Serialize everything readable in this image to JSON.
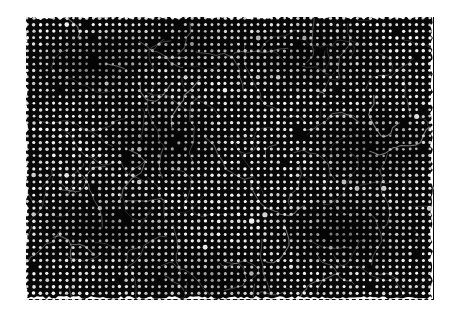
{
  "page": {
    "width": 462,
    "height": 316,
    "background_color": "#ffffff",
    "document_type": "scanned-halftone-photograph",
    "caption": ""
  },
  "plate": {
    "name": "halftone-screened-photograph",
    "x": 26,
    "y": 17,
    "width": 408,
    "height": 283,
    "ink_color": "#070707",
    "dot_color": "#ffffff",
    "description": "Dense black halftone screen; a dark, low-key photographic reproduction rendered as a regular grid of small white dots on solid black ink.",
    "halftone": {
      "pitch_x": 6.6,
      "pitch_y": 6.55,
      "dot_radius": 1.55,
      "screen_angle_deg": 0,
      "dot_shape": "round",
      "row_offset": 0
    },
    "edges": {
      "ragged": true,
      "ragged_amplitude_px": 3
    },
    "tone_blotches": [
      {
        "cx": 0.16,
        "cy": 0.17,
        "rx": 0.18,
        "ry": 0.15,
        "level": -0.22
      },
      {
        "cx": 0.4,
        "cy": 0.1,
        "rx": 0.22,
        "ry": 0.12,
        "level": -0.16
      },
      {
        "cx": 0.7,
        "cy": 0.14,
        "rx": 0.2,
        "ry": 0.14,
        "level": -0.18
      },
      {
        "cx": 0.92,
        "cy": 0.2,
        "rx": 0.14,
        "ry": 0.18,
        "level": 0.14
      },
      {
        "cx": 0.09,
        "cy": 0.47,
        "rx": 0.14,
        "ry": 0.2,
        "level": 0.16
      },
      {
        "cx": 0.33,
        "cy": 0.43,
        "rx": 0.19,
        "ry": 0.17,
        "level": -0.2
      },
      {
        "cx": 0.6,
        "cy": 0.4,
        "rx": 0.17,
        "ry": 0.16,
        "level": 0.12
      },
      {
        "cx": 0.84,
        "cy": 0.46,
        "rx": 0.18,
        "ry": 0.17,
        "level": -0.22
      },
      {
        "cx": 0.2,
        "cy": 0.74,
        "rx": 0.2,
        "ry": 0.16,
        "level": -0.18
      },
      {
        "cx": 0.5,
        "cy": 0.7,
        "rx": 0.22,
        "ry": 0.18,
        "level": 0.13
      },
      {
        "cx": 0.78,
        "cy": 0.76,
        "rx": 0.19,
        "ry": 0.16,
        "level": -0.24
      },
      {
        "cx": 0.96,
        "cy": 0.64,
        "rx": 0.12,
        "ry": 0.2,
        "level": 0.15
      },
      {
        "cx": 0.44,
        "cy": 0.92,
        "rx": 0.24,
        "ry": 0.12,
        "level": -0.15
      },
      {
        "cx": 0.12,
        "cy": 0.93,
        "rx": 0.16,
        "ry": 0.12,
        "level": 0.14
      }
    ],
    "scratch_count": 120,
    "scratch_color": "#f2f2f2"
  }
}
